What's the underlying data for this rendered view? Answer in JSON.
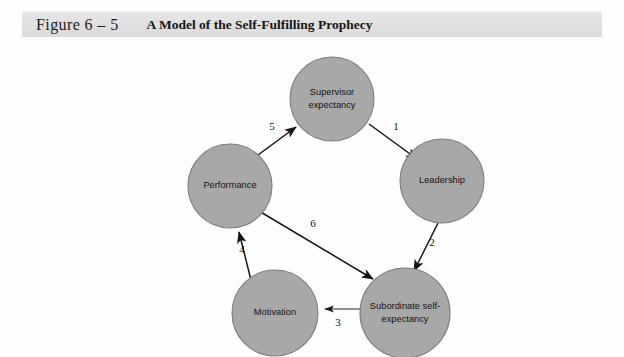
{
  "caption": {
    "figure_label": "Figure 6 – 5",
    "title": "A Model of the Self-Fulfilling Prophecy"
  },
  "diagram": {
    "nodes": [
      {
        "id": "supervisor-expectancy",
        "line1": "Supervisor",
        "line2": "expectancy"
      },
      {
        "id": "leadership",
        "line1": "Leadership",
        "line2": ""
      },
      {
        "id": "subordinate-self-expectancy",
        "line1": "Subordinate self-",
        "line2": "expectancy"
      },
      {
        "id": "motivation",
        "line1": "Motivation",
        "line2": ""
      },
      {
        "id": "performance",
        "line1": "Performance",
        "line2": ""
      }
    ],
    "edges": [
      {
        "id": "edge-1",
        "number": "1",
        "from": "supervisor-expectancy",
        "to": "leadership"
      },
      {
        "id": "edge-2",
        "number": "2",
        "from": "leadership",
        "to": "subordinate-self-expectancy"
      },
      {
        "id": "edge-3",
        "number": "3",
        "from": "subordinate-self-expectancy",
        "to": "motivation"
      },
      {
        "id": "edge-4",
        "number": "4",
        "from": "motivation",
        "to": "performance"
      },
      {
        "id": "edge-5",
        "number": "5",
        "from": "performance",
        "to": "supervisor-expectancy"
      },
      {
        "id": "edge-6",
        "number": "6",
        "from": "performance",
        "to": "subordinate-self-expectancy"
      }
    ],
    "colors": {
      "node_fill": "#a8a8a8",
      "node_stroke": "#7d7d7d",
      "edge_stroke": "#141414",
      "caption_bar": "#e2e2e2",
      "page_background": "#ffffff"
    }
  }
}
